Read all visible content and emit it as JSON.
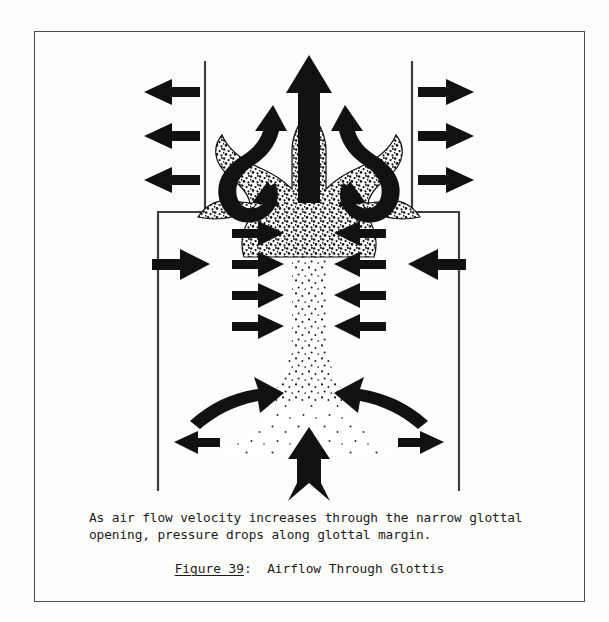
{
  "page": {
    "background_color": "#fdfdfc",
    "frame_color": "#4a4a4a"
  },
  "caption": {
    "body": "As air flow velocity increases through the narrow glottal\nopening, pressure drops along glottal margin.",
    "figure_label": "Figure 39",
    "separator": ":  ",
    "figure_title": "Airflow Through Glottis"
  },
  "figure": {
    "title": "Airflow Through Glottis",
    "ink_color": "#111111",
    "line_color": "#3f3f3f",
    "stipple_color": "#1a1a1a",
    "elements": {
      "supraglottal_cavity_wall_left": "vertical wall left of upper cavity",
      "supraglottal_cavity_wall_right": "vertical wall right of upper cavity",
      "subglottal_cavity_wall_left": "vertical wall left of lower cavity",
      "subglottal_cavity_wall_right": "vertical wall right of lower cavity",
      "glottal_channel": "narrow stippled vertical channel",
      "airflow_jet": "stippled plume expanding above glottis",
      "central_jet_arrow": "large upward arrow at top of plume",
      "inlet_arrow": "notched upward arrow entering from below",
      "vortex_arrow_left": "curling vortex arrow left of plume",
      "vortex_arrow_right": "curling vortex arrow right of plume",
      "outward_arrows_left": 3,
      "outward_arrows_right": 3,
      "inward_arrows_left": 4,
      "inward_arrows_right": 4,
      "wall_pressure_arrow_left": "single large inward arrow mid-left",
      "wall_pressure_arrow_right": "single large inward arrow mid-right",
      "converging_arrow_left": "curved arrow toward glottal inlet, left",
      "converging_arrow_right": "curved arrow toward glottal inlet, right",
      "lower_outward_arrow_left": "small leftward arrow in lower cavity",
      "lower_outward_arrow_right": "small rightward arrow in lower cavity"
    }
  }
}
